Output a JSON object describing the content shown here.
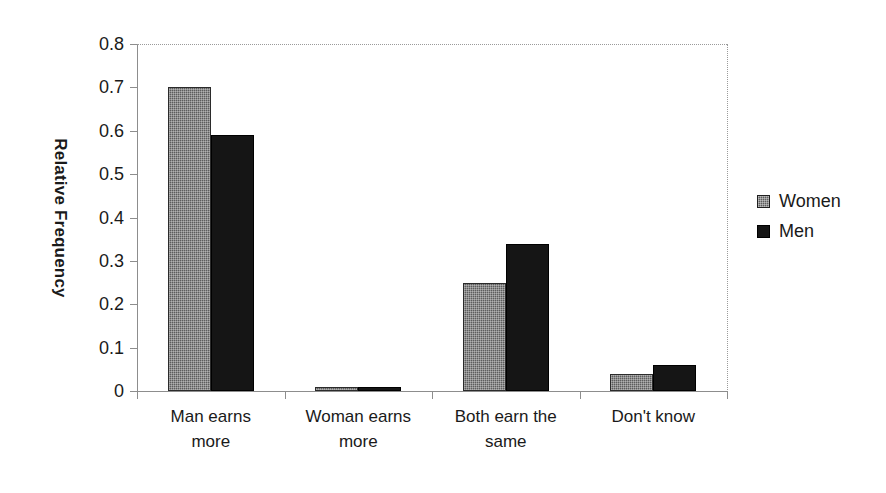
{
  "chart_data": {
    "type": "bar",
    "title": "",
    "xlabel": "",
    "ylabel": "Relative Frequency",
    "ylim": [
      0,
      0.8
    ],
    "ytick_labels": [
      "0.8",
      "0.7",
      "0.6",
      "0.5",
      "0.4",
      "0.3",
      "0.2",
      "0.1",
      "0"
    ],
    "ytick_values": [
      0.8,
      0.7,
      0.6,
      0.5,
      0.4,
      0.3,
      0.2,
      0.1,
      0
    ],
    "grid": "top-and-right-dotted-border-only",
    "legend_position": "right",
    "categories": [
      "Man earns more",
      "Woman earns more",
      "Both earn the same",
      "Don't know"
    ],
    "category_label_lines": [
      [
        "Man earns",
        "more"
      ],
      [
        "Woman earns",
        "more"
      ],
      [
        "Both earn the",
        "same"
      ],
      [
        "Don't know"
      ]
    ],
    "series": [
      {
        "name": "Women",
        "color": "#5d5d5d",
        "values": [
          0.7,
          0.01,
          0.25,
          0.04
        ]
      },
      {
        "name": "Men",
        "color": "#151515",
        "values": [
          0.59,
          0.01,
          0.34,
          0.06
        ]
      }
    ]
  },
  "legend": {
    "items": [
      {
        "label": "Women",
        "swatch": "women"
      },
      {
        "label": "Men",
        "swatch": "men"
      }
    ]
  }
}
